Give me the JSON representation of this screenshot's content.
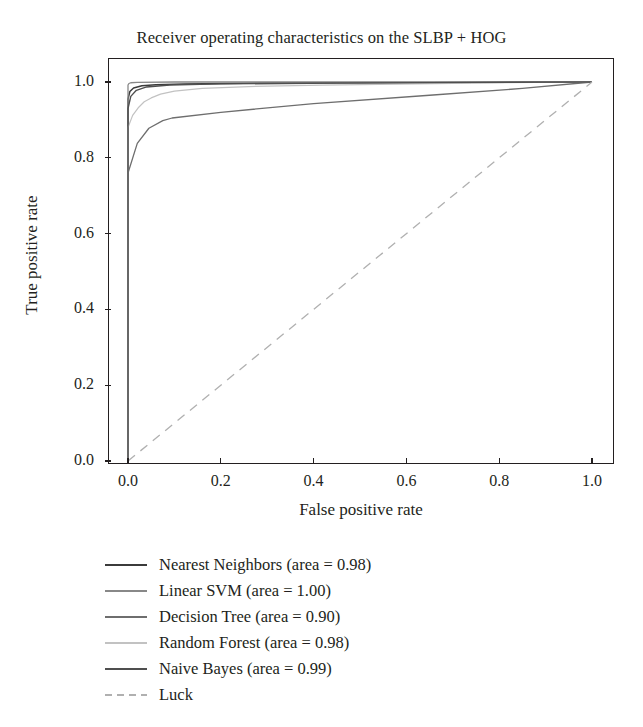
{
  "chart_data": {
    "type": "line",
    "title": "Receiver operating characteristics on the SLBP + HOG",
    "xlabel": "False positive rate",
    "ylabel": "True positive rate",
    "xlim": [
      0.0,
      1.0
    ],
    "ylim": [
      0.0,
      1.0
    ],
    "grid": false,
    "legend_position": "below-axes-left",
    "xticks": [
      "0.0",
      "0.2",
      "0.4",
      "0.6",
      "0.8",
      "1.0"
    ],
    "xtick_values": [
      0.0,
      0.2,
      0.4,
      0.6,
      0.8,
      1.0
    ],
    "yticks": [
      "0.0",
      "0.2",
      "0.4",
      "0.6",
      "0.8",
      "1.0"
    ],
    "ytick_values": [
      0.0,
      0.2,
      0.4,
      0.6,
      0.8,
      1.0
    ],
    "series": [
      {
        "name": "Nearest Neighbors",
        "area": 0.98,
        "legend_label": "Nearest Neighbors (area = 0.98)",
        "color": "#3b3b3b",
        "linewidth": 1.5,
        "dash": "solid",
        "x": [
          0.0,
          0.0,
          0.004,
          0.012,
          0.03,
          0.06,
          0.12,
          0.25,
          0.45,
          0.7,
          1.0
        ],
        "y": [
          0.0,
          0.955,
          0.975,
          0.984,
          0.99,
          0.993,
          0.995,
          0.997,
          0.998,
          0.999,
          1.0
        ]
      },
      {
        "name": "Linear SVM",
        "area": 1.0,
        "legend_label": "Linear SVM (area = 1.00)",
        "color": "#888888",
        "linewidth": 1.3,
        "dash": "solid",
        "x": [
          0.0,
          0.0,
          0.002,
          0.006,
          0.02,
          0.1,
          0.4,
          1.0
        ],
        "y": [
          0.0,
          0.992,
          0.996,
          0.998,
          0.999,
          1.0,
          1.0,
          1.0
        ]
      },
      {
        "name": "Decision Tree",
        "area": 0.9,
        "legend_label": "Decision Tree (area = 0.90)",
        "color": "#6e6e6e",
        "linewidth": 1.3,
        "dash": "solid",
        "x": [
          0.0,
          0.0,
          0.02,
          0.045,
          0.075,
          0.095,
          0.2,
          0.4,
          0.65,
          0.85,
          1.0
        ],
        "y": [
          0.0,
          0.76,
          0.838,
          0.878,
          0.898,
          0.905,
          0.92,
          0.943,
          0.965,
          0.983,
          1.0
        ]
      },
      {
        "name": "Random Forest",
        "area": 0.98,
        "legend_label": "Random Forest (area = 0.98)",
        "color": "#c2c2c2",
        "linewidth": 1.2,
        "dash": "solid",
        "x": [
          0.0,
          0.0,
          0.01,
          0.022,
          0.035,
          0.05,
          0.07,
          0.1,
          0.16,
          0.26,
          0.42,
          0.62,
          0.82,
          1.0
        ],
        "y": [
          0.0,
          0.88,
          0.912,
          0.932,
          0.948,
          0.958,
          0.968,
          0.976,
          0.983,
          0.988,
          0.992,
          0.995,
          0.998,
          1.0
        ]
      },
      {
        "name": "Naive Bayes",
        "area": 0.99,
        "legend_label": "Naive Bayes (area = 0.99)",
        "color": "#4f4f4f",
        "linewidth": 1.4,
        "dash": "solid",
        "x": [
          0.0,
          0.0,
          0.006,
          0.018,
          0.04,
          0.09,
          0.2,
          0.45,
          0.75,
          1.0
        ],
        "y": [
          0.0,
          0.93,
          0.962,
          0.978,
          0.987,
          0.992,
          0.995,
          0.997,
          0.999,
          1.0
        ]
      },
      {
        "name": "Luck",
        "area": null,
        "legend_label": "Luck",
        "color": "#b0b0b0",
        "linewidth": 1.3,
        "dash": "dashed",
        "x": [
          0.0,
          1.0
        ],
        "y": [
          0.0,
          1.0
        ]
      }
    ]
  },
  "chart": {
    "title": "Receiver operating characteristics on the SLBP + HOG",
    "xlabel": "False positive rate",
    "ylabel": "True positive rate"
  },
  "axis": {
    "x_tick_labels": [
      "0.0",
      "0.2",
      "0.4",
      "0.6",
      "0.8",
      "1.0"
    ],
    "y_tick_labels": [
      "0.0",
      "0.2",
      "0.4",
      "0.6",
      "0.8",
      "1.0"
    ]
  },
  "legend": {
    "items": [
      {
        "label": "Nearest Neighbors (area = 0.98)",
        "color": "#3b3b3b",
        "dash": "solid"
      },
      {
        "label": "Linear SVM (area = 1.00)",
        "color": "#888888",
        "dash": "solid"
      },
      {
        "label": "Decision Tree (area = 0.90)",
        "color": "#6e6e6e",
        "dash": "solid"
      },
      {
        "label": "Random Forest (area = 0.98)",
        "color": "#c2c2c2",
        "dash": "solid"
      },
      {
        "label": "Naive Bayes (area = 0.99)",
        "color": "#4f4f4f",
        "dash": "solid"
      },
      {
        "label": "Luck",
        "color": "#b0b0b0",
        "dash": "dashed"
      }
    ]
  }
}
